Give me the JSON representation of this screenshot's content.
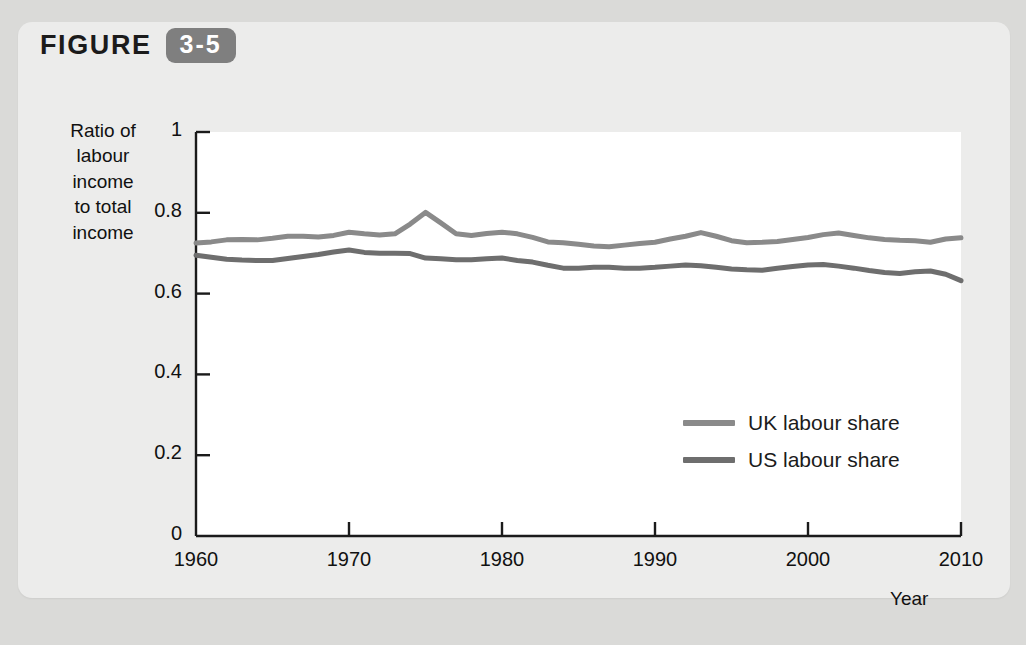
{
  "figure": {
    "word": "FIGURE",
    "number": "3-5",
    "badge_color": "#7f7f7f"
  },
  "page": {
    "background_color": "#dadad8",
    "card_color": "#ececeb",
    "ghost_lines": [
      "the purpose of measuring the functional distribution",
      "The marginal product of the Cobb-Douglas production function is"
    ]
  },
  "chart_data": {
    "type": "line",
    "title": "",
    "xlabel": "Year",
    "ylabel": "Ratio of labour income to total income",
    "ylabel_lines": [
      "Ratio of",
      "labour",
      "income",
      "to total",
      "income"
    ],
    "xlim": [
      1960,
      2010
    ],
    "ylim": [
      0,
      1
    ],
    "xticks": [
      1960,
      1970,
      1980,
      1990,
      2000,
      2010
    ],
    "xtick_labels": [
      "1960",
      "1970",
      "1980",
      "1990",
      "2000",
      "2010"
    ],
    "yticks": [
      0,
      0.2,
      0.4,
      0.6,
      0.8,
      1
    ],
    "ytick_labels": [
      "0",
      "0.2",
      "0.4",
      "0.6",
      "0.8",
      "1"
    ],
    "grid": false,
    "legend_position": "center-right",
    "x": [
      1960,
      1961,
      1962,
      1963,
      1964,
      1965,
      1966,
      1967,
      1968,
      1969,
      1970,
      1971,
      1972,
      1973,
      1974,
      1975,
      1976,
      1977,
      1978,
      1979,
      1980,
      1981,
      1982,
      1983,
      1984,
      1985,
      1986,
      1987,
      1988,
      1989,
      1990,
      1991,
      1992,
      1993,
      1994,
      1995,
      1996,
      1997,
      1998,
      1999,
      2000,
      2001,
      2002,
      2003,
      2004,
      2005,
      2006,
      2007,
      2008,
      2009,
      2010
    ],
    "series": [
      {
        "name": "UK labour share",
        "color": "#8a8a8a",
        "values": [
          0.725,
          0.728,
          0.733,
          0.734,
          0.733,
          0.737,
          0.742,
          0.742,
          0.74,
          0.744,
          0.752,
          0.748,
          0.745,
          0.748,
          0.772,
          0.801,
          0.775,
          0.748,
          0.744,
          0.749,
          0.752,
          0.748,
          0.739,
          0.728,
          0.726,
          0.722,
          0.718,
          0.716,
          0.72,
          0.724,
          0.727,
          0.735,
          0.742,
          0.751,
          0.742,
          0.731,
          0.726,
          0.727,
          0.729,
          0.734,
          0.739,
          0.746,
          0.75,
          0.744,
          0.738,
          0.734,
          0.732,
          0.731,
          0.727,
          0.735,
          0.738
        ]
      },
      {
        "name": "US labour share",
        "color": "#6e6e6e",
        "values": [
          0.695,
          0.69,
          0.685,
          0.683,
          0.682,
          0.682,
          0.687,
          0.692,
          0.697,
          0.703,
          0.708,
          0.702,
          0.7,
          0.7,
          0.699,
          0.688,
          0.686,
          0.684,
          0.684,
          0.686,
          0.688,
          0.682,
          0.678,
          0.67,
          0.663,
          0.663,
          0.665,
          0.665,
          0.663,
          0.663,
          0.665,
          0.668,
          0.671,
          0.669,
          0.665,
          0.661,
          0.659,
          0.658,
          0.663,
          0.667,
          0.671,
          0.672,
          0.668,
          0.663,
          0.657,
          0.652,
          0.65,
          0.654,
          0.656,
          0.648,
          0.632
        ]
      }
    ]
  },
  "legend": {
    "items": [
      {
        "label": "UK labour share",
        "color": "#8a8a8a"
      },
      {
        "label": "US labour share",
        "color": "#6e6e6e"
      }
    ]
  }
}
